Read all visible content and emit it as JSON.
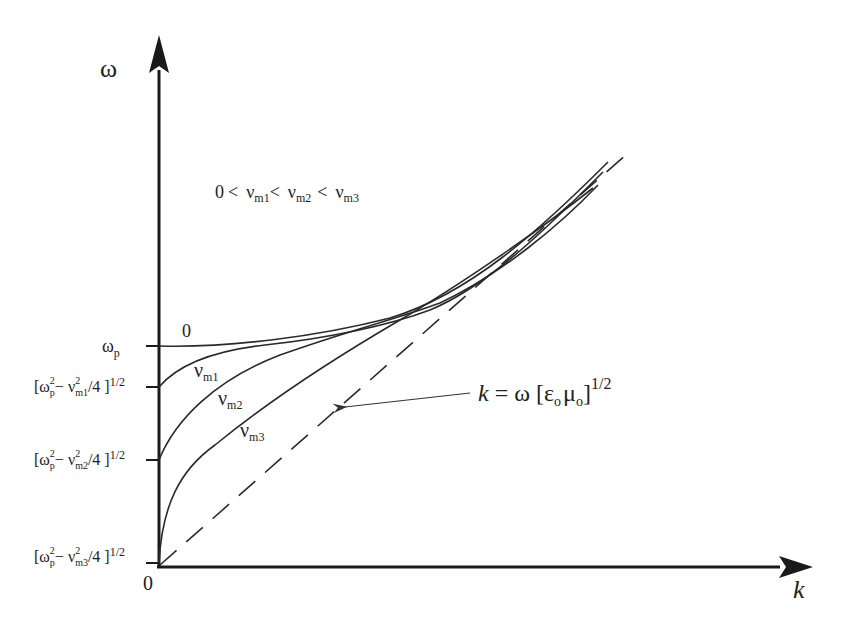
{
  "diagram": {
    "axes": {
      "y_label": "ω",
      "x_label": "k",
      "origin_label": "0"
    },
    "condition_text": {
      "zero": "0",
      "lt1": "<",
      "nu": "ν",
      "m1": "m1",
      "lt2": "<",
      "m2": "m2",
      "lt3": "<",
      "m3": "m3"
    },
    "y_ticks": [
      {
        "id": "wp",
        "main": "ω",
        "sub": "p",
        "y": 346
      },
      {
        "id": "nu_m1",
        "pre": "[ω",
        "sup1": "2",
        "sub1": "p",
        "minus": "− ν",
        "sup2": "2",
        "sub2": "m1",
        "post": "/4 ]",
        "exp": "1/2",
        "y": 387
      },
      {
        "id": "nu_m2",
        "pre": "[ω",
        "sup1": "2",
        "sub1": "p",
        "minus": "− ν",
        "sup2": "2",
        "sub2": "m2",
        "post": "/4 ]",
        "exp": "1/2",
        "y": 460
      },
      {
        "id": "nu_m3",
        "pre": "[ω",
        "sup1": "2",
        "sub1": "p",
        "minus": "− ν",
        "sup2": "2",
        "sub2": "m3",
        "post": "/4 ]",
        "exp": "1/2",
        "y": 563
      }
    ],
    "curves": [
      {
        "label": "0",
        "label_sub": ""
      },
      {
        "label": "ν",
        "label_sub": "m1"
      },
      {
        "label": "ν",
        "label_sub": "m2"
      },
      {
        "label": "ν",
        "label_sub": "m3"
      }
    ],
    "light_line": {
      "k": "k",
      "eq": "= ω [ε",
      "sub_o1": "o",
      "mu": "μ",
      "sub_o2": "o",
      "close": "]",
      "exp": "1/2"
    },
    "colors": {
      "ink": "#222222",
      "background": "#ffffff"
    }
  }
}
